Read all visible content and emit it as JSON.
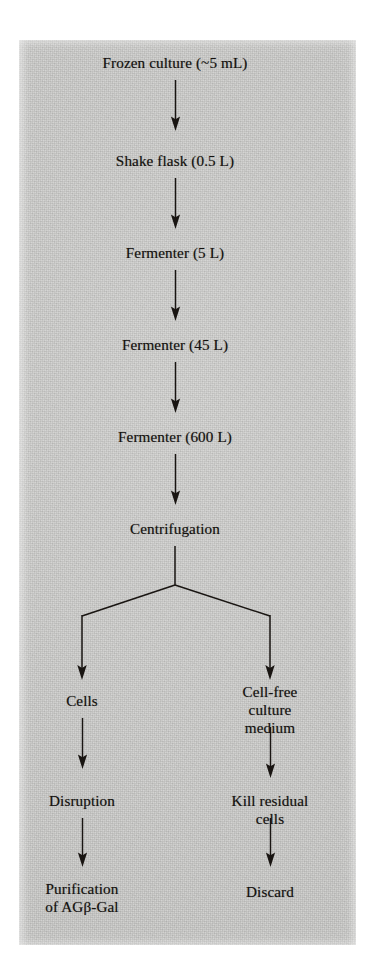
{
  "figure": {
    "type": "process-flow-diagram",
    "background_color": "#cdcdcb",
    "ink_color": "#191512",
    "nodes": {
      "frozen_culture": "Frozen culture (~5 mL)",
      "shake_flask": "Shake flask (0.5 L)",
      "fermenter_5l": "Fermenter (5 L)",
      "fermenter_45l": "Fermenter (45 L)",
      "fermenter_600l": "Fermenter (600 L)",
      "centrifugation": "Centrifugation",
      "cells": "Cells",
      "cell_free_medium": "Cell-free culture\nmedium",
      "disruption": "Disruption",
      "kill_residual_cells": "Kill residual cells",
      "purification": "Purification\nof AGβ-Gal",
      "discard": "Discard"
    },
    "flow_sequence": [
      "Frozen culture (~5 mL)",
      "Shake flask (0.5 L)",
      "Fermenter (5 L)",
      "Fermenter (45 L)",
      "Fermenter (600 L)",
      "Centrifugation"
    ],
    "branches": {
      "left": [
        "Cells",
        "Disruption",
        "Purification of AGβ-Gal"
      ],
      "right": [
        "Cell-free culture medium",
        "Kill residual cells",
        "Discard"
      ]
    }
  }
}
